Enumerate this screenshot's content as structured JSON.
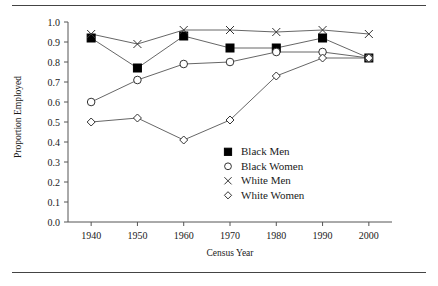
{
  "chart_data": {
    "type": "line",
    "title": "",
    "xlabel": "Census Year",
    "ylabel": "Proportion Employed",
    "x": [
      1940,
      1950,
      1960,
      1970,
      1980,
      1990,
      2000
    ],
    "xtick_labels": [
      "1940",
      "1950",
      "1960",
      "1970",
      "1980",
      "1990",
      "2000"
    ],
    "ytick_labels": [
      "0.0",
      "0.1",
      "0.2",
      "0.3",
      "0.4",
      "0.5",
      "0.6",
      "0.7",
      "0.8",
      "0.9",
      "1.0"
    ],
    "ylim": [
      0.0,
      1.0
    ],
    "xlim": [
      1935,
      2005
    ],
    "grid": false,
    "legend_position": "center-right",
    "series": [
      {
        "name": "Black Men",
        "marker": "filled-square",
        "values": [
          0.92,
          0.77,
          0.93,
          0.87,
          0.87,
          0.92,
          0.82
        ]
      },
      {
        "name": "Black Women",
        "marker": "open-circle",
        "values": [
          0.6,
          0.71,
          0.79,
          0.8,
          0.85,
          0.85,
          0.82
        ]
      },
      {
        "name": "White Men",
        "marker": "cross",
        "values": [
          0.94,
          0.89,
          0.96,
          0.96,
          0.95,
          0.96,
          0.94
        ]
      },
      {
        "name": "White Women",
        "marker": "open-diamond",
        "values": [
          0.5,
          0.52,
          0.41,
          0.51,
          0.73,
          0.82,
          0.82
        ]
      }
    ],
    "colors": {
      "line": "#555555",
      "marker_fill": "#000000",
      "marker_stroke": "#333333",
      "axis": "#555555",
      "text": "#1a1a1a"
    }
  }
}
